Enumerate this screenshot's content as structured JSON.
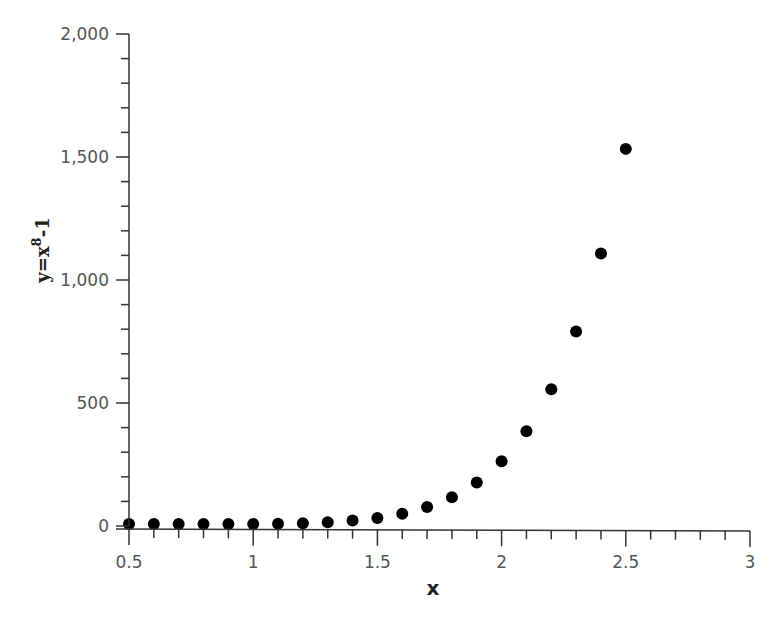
{
  "chart_data": {
    "type": "scatter",
    "title": "",
    "xlabel": "x",
    "ylabel": "y=x^8-1",
    "ylabel_parts": {
      "base": "y=x",
      "sup": "8",
      "tail": "-1"
    },
    "xlim": [
      0.5,
      3
    ],
    "ylim": [
      0,
      2000
    ],
    "grid": false,
    "legend": null,
    "x_ticks": [
      0.5,
      1,
      1.5,
      2,
      2.5,
      3
    ],
    "x_tick_labels": [
      "0.5",
      "1",
      "1.5",
      "2",
      "2.5",
      "3"
    ],
    "x_minor_step": 0.1,
    "y_ticks": [
      0,
      500,
      1000,
      1500,
      2000
    ],
    "y_tick_labels": [
      "0",
      "500",
      "1,000",
      "1,500",
      "2,000"
    ],
    "y_minor_step": 100,
    "series": [
      {
        "name": "y=x^8-1",
        "marker": "circle",
        "color": "#000000",
        "x": [
          0.5,
          0.6,
          0.7,
          0.8,
          0.9,
          1.0,
          1.1,
          1.2,
          1.3,
          1.4,
          1.5,
          1.6,
          1.7,
          1.8,
          1.9,
          2.0,
          2.1,
          2.2,
          2.3,
          2.4,
          2.5
        ],
        "y": [
          -0.996,
          -0.983,
          -0.942,
          -0.832,
          -0.57,
          0,
          1.144,
          3.3,
          7.157,
          13.758,
          24.629,
          41.95,
          68.758,
          109.199,
          168.836,
          255,
          377.225,
          547.736,
          782.106,
          1099.512,
          1524.879
        ]
      }
    ]
  }
}
